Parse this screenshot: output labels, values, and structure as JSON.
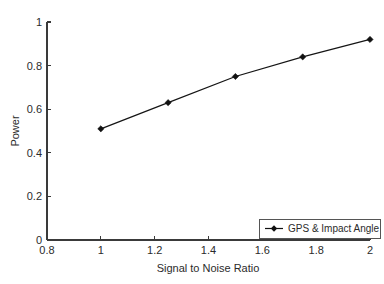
{
  "chart_data": {
    "type": "line",
    "title": "",
    "xlabel": "Signal to Noise Ratio",
    "ylabel": "Power",
    "xlim": [
      0.8,
      2
    ],
    "ylim": [
      0,
      1
    ],
    "grid": false,
    "legend_position": "bottom-right",
    "xticks": [
      "0.8",
      "1",
      "1.2",
      "1.4",
      "1.6",
      "1.8",
      "2"
    ],
    "xtick_values": [
      0.8,
      1,
      1.2,
      1.4,
      1.6,
      1.8,
      2
    ],
    "yticks": [
      "0",
      "0.2",
      "0.4",
      "0.6",
      "0.8",
      "1"
    ],
    "ytick_values": [
      0,
      0.2,
      0.4,
      0.6,
      0.8,
      1
    ],
    "x": [
      1,
      1.25,
      1.5,
      1.75,
      2
    ],
    "series": [
      {
        "name": "GPS & Impact Angle",
        "values": [
          0.51,
          0.63,
          0.75,
          0.84,
          0.92
        ],
        "color": "#111111",
        "marker": "diamond"
      }
    ]
  },
  "legend": {
    "entries": [
      {
        "label": "GPS & Impact Angle",
        "marker_name": "line-diamond-marker"
      }
    ]
  },
  "colors": {
    "background": "#ffffff",
    "axis": "#3a3a3a",
    "series": "#111111",
    "text": "#2b2b2b"
  }
}
